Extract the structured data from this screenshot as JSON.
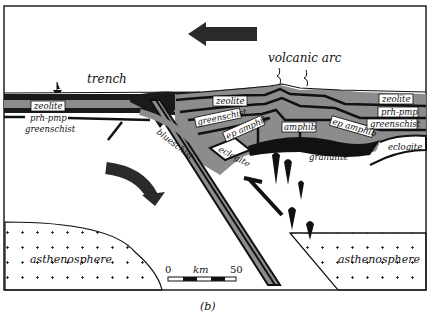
{
  "figure": {
    "panel_label": "(b)",
    "title_labels": {
      "trench": "trench",
      "volcanic_arc": "volcanic arc"
    },
    "facies_labels": {
      "zeolite_left": "zeolite",
      "prh_pmp_left": "prh-pmp",
      "greenschist_left": "greenschist",
      "zeolite_center": "zeolite",
      "greenschist_center": "greenschist",
      "ep_amphib_left": "ep amphib",
      "amphib": "amphib",
      "ep_amphib_right": "ep amphib",
      "zeolite_right": "zeolite",
      "prh_pmp_right": "prh-pmp",
      "greenschist_right": "greenschist",
      "blueschist": "blueschist",
      "eclogite_left": "eclogite",
      "eclogite_right": "eclogite",
      "granulite": "granulite"
    },
    "regions": {
      "asthenosphere_left": "asthenosphere",
      "asthenosphere_right": "asthenosphere"
    },
    "scale_bar": {
      "start": "0",
      "unit": "km",
      "end": "50"
    },
    "arrows": [
      {
        "name": "plate-motion-arrow",
        "direction": "left"
      },
      {
        "name": "mantle-flow-arrow",
        "direction": "curved-down-right"
      },
      {
        "name": "slab-exhumation-arrow",
        "direction": "up-left"
      }
    ],
    "colors": {
      "frame": "#111111",
      "dark_layer": "#1a1a1a",
      "grey_layer": "#8c8c8c",
      "background": "#ffffff"
    }
  }
}
